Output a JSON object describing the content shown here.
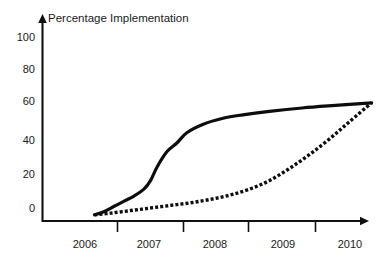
{
  "chart_data": {
    "type": "line",
    "title": "Percentage Implementation",
    "xlabel": "",
    "ylabel": "",
    "grid": false,
    "legend": "none",
    "xlim": [
      2005.6,
      2010.4
    ],
    "ylim": [
      -6,
      105
    ],
    "x_ticks": [
      "2006",
      "2007",
      "2008",
      "2009",
      "2010"
    ],
    "y_ticks": [
      "0",
      "20",
      "40",
      "60",
      "80",
      "100"
    ],
    "y_tick_values": [
      0,
      20,
      40,
      60,
      80,
      100
    ],
    "series": [
      {
        "name": "solid-curve",
        "style": "solid",
        "color": "#0d0d0d",
        "x": [
          2005.65,
          2005.8,
          2005.95,
          2006.1,
          2006.25,
          2006.4,
          2006.5,
          2006.6,
          2006.75,
          2006.9,
          2007.05,
          2007.3,
          2007.6,
          2007.9,
          2008.3,
          2008.8,
          2009.3,
          2009.85
        ],
        "values": [
          -4,
          -2,
          1,
          4,
          7,
          11,
          16,
          24,
          33,
          38,
          44,
          49,
          52.5,
          54.5,
          56.5,
          58.5,
          60,
          61.5
        ]
      },
      {
        "name": "dotted-curve",
        "style": "dotted",
        "color": "#0d0d0d",
        "x": [
          2005.65,
          2005.9,
          2006.2,
          2006.5,
          2006.8,
          2007.1,
          2007.4,
          2007.7,
          2008.0,
          2008.3,
          2008.6,
          2008.9,
          2009.2,
          2009.5,
          2009.85
        ],
        "values": [
          -4,
          -3,
          -1.5,
          0,
          1.5,
          3,
          5,
          7.5,
          11,
          16,
          23,
          31,
          40,
          50,
          61.5
        ]
      }
    ]
  },
  "axes": {
    "y_axis_name": "y-axis",
    "x_axis_name": "x-axis"
  }
}
